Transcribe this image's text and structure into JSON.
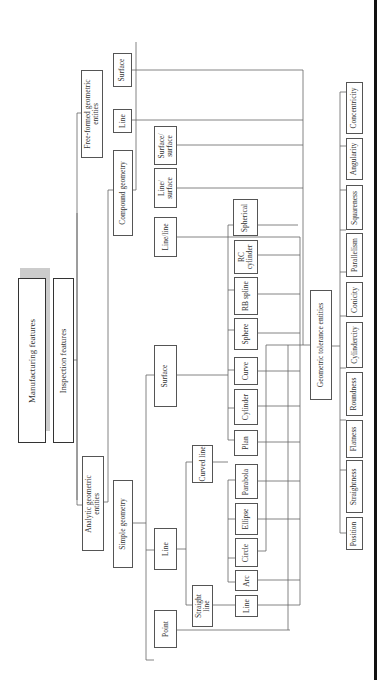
{
  "diagram": {
    "type": "hierarchy-tree",
    "orientation": "rotated-90",
    "root": "Manufacturing features",
    "nodes": {
      "manufacturing": "Manufacturing features",
      "inspection": "Inspection features",
      "analytic": "Analytic geometric\nentities",
      "freeformed": "Free-formed geometric\nentities",
      "simple": "Simple geometry",
      "compound": "Compound geometry",
      "point": "Point",
      "line": "Line",
      "surface": "Surface",
      "straight_line": "Straight\nline",
      "curved_line": "Curved line",
      "line_leaf": "Line",
      "arc": "Arc",
      "circle": "Circle",
      "ellipse": "Ellipse",
      "parabola": "Parabola",
      "plan": "Plan",
      "cylinder": "Cylinder",
      "curve": "Curve",
      "sphere": "Sphere",
      "rb_spline": "RB spline",
      "rc_cylinder": "RC\ncylinder",
      "spherical": "Spherical",
      "line_line": "Line/line",
      "line_surface": "Line/\nsurface",
      "surface_surface": "Surface/\nsurface",
      "ff_line": "Line",
      "ff_surface": "Surface",
      "gte": "Geometric tolerance entities",
      "position": "Position",
      "straightness": "Straightness",
      "flatness": "Flatness",
      "roundness": "Roundness",
      "cylindricity": "Cylindercity",
      "conicity": "Conicity",
      "parallelism": "Parallelism",
      "squareness": "Squareness",
      "angularity": "Angularity",
      "concentricity": "Concentricity"
    }
  }
}
